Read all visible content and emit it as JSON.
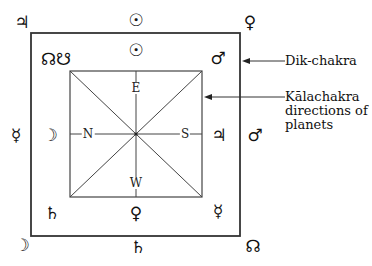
{
  "diagram": {
    "outer_square": {
      "name": "Dik-chakra",
      "x1": 31,
      "y1": 33,
      "x2": 240,
      "y2": 236
    },
    "inner_square": {
      "name": "Kalachakra",
      "x1": 70,
      "y1": 71,
      "x2": 202,
      "y2": 197
    },
    "directions": {
      "east": "E",
      "west": "W",
      "north": "N",
      "south": "S"
    },
    "outer_planets": {
      "top_left": "♃",
      "top_center": "☉",
      "top_right": "♀",
      "left_center": "☿",
      "right_center": "♂",
      "bottom_left": "☽",
      "bottom_center": "♄",
      "bottom_right": "☊"
    },
    "inner_planets": {
      "top_left": "☊☋",
      "top_center": "☉",
      "top_right": "♂",
      "left_center": "☽",
      "right_center": "♃",
      "bottom_left": "♄",
      "bottom_center": "♀",
      "bottom_right": "☿"
    },
    "labels": {
      "dik_chakra": "Dik-chakra",
      "kalachakra_line1": "Kālachakra",
      "kalachakra_line2": "directions of",
      "kalachakra_line3": "planets"
    }
  }
}
